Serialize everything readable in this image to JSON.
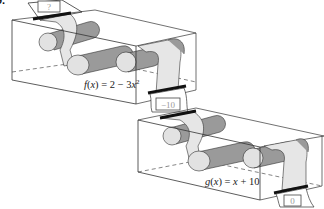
{
  "problem": {
    "number": "9."
  },
  "machines": [
    {
      "id": "f",
      "label": "f(x) = 2 − 3x²",
      "label_parts": {
        "name": "f",
        "var": "x",
        "rhs_const": "2",
        "rhs_op": "−",
        "rhs_coef": "3",
        "rhs_var": "x",
        "rhs_exp": "2"
      },
      "input_box": "?",
      "output_box": "−10"
    },
    {
      "id": "g",
      "label": "g(x) = x + 10",
      "label_parts": {
        "name": "g",
        "var": "x",
        "rhs_var": "x",
        "rhs_op": "+",
        "rhs_const": "10"
      },
      "input_box": "−10",
      "output_box": "0"
    }
  ],
  "colors": {
    "outline": "#333333",
    "belt": "#e6e6e6",
    "roller_light": "#e2e2e2",
    "roller_dark": "#9a9a9a",
    "bar": "#111111"
  }
}
